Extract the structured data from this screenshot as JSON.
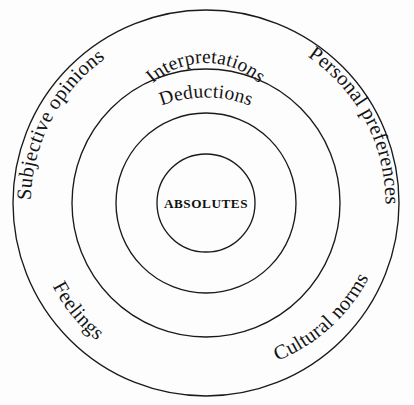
{
  "diagram": {
    "background_color": "#fdfdfd",
    "stroke_color": "#1a1a1a",
    "center": {
      "x": 206,
      "y": 203
    },
    "center_label": "ABSOLUTES",
    "rings": [
      {
        "name": "absolutes",
        "radius": 49,
        "label": "ABSOLUTES"
      },
      {
        "name": "interpretations",
        "radius": 90,
        "label": "Interpretations"
      },
      {
        "name": "deductions",
        "radius": 134,
        "label": "Deductions"
      },
      {
        "name": "outer",
        "radius": 193,
        "label": ""
      }
    ],
    "arc_labels": [
      {
        "id": "interpretations",
        "text": "Interpretations",
        "ring": "interpretations",
        "position": "top"
      },
      {
        "id": "deductions",
        "text": "Deductions",
        "ring": "deductions",
        "position": "top"
      },
      {
        "id": "subjective-opinions",
        "text": "Subjective opinions",
        "ring": "outer",
        "position": "top-left"
      },
      {
        "id": "personal-preferences",
        "text": "Personal preferences",
        "ring": "outer",
        "position": "top-right"
      },
      {
        "id": "feelings",
        "text": "Feelings",
        "ring": "outer",
        "position": "bottom-left"
      },
      {
        "id": "cultural-norms",
        "text": "Cultural norms",
        "ring": "outer",
        "position": "bottom-right"
      }
    ]
  }
}
